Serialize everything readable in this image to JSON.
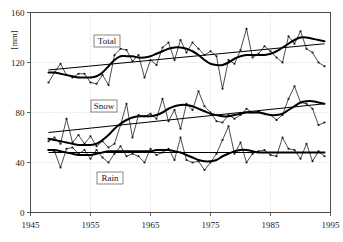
{
  "chart_data": {
    "type": "line",
    "title": "",
    "xlabel": "",
    "ylabel": "[mm]",
    "xlim": [
      1945,
      1995
    ],
    "ylim": [
      0,
      160
    ],
    "xticks": [
      1945,
      1955,
      1965,
      1975,
      1985,
      1995
    ],
    "yticks": [
      0,
      40,
      80,
      120,
      160
    ],
    "grid": true,
    "legend_position": "inline-boxed",
    "annotations": [
      "Total",
      "Snow",
      "Rain"
    ],
    "x": [
      1948,
      1949,
      1950,
      1951,
      1952,
      1953,
      1954,
      1955,
      1956,
      1957,
      1958,
      1959,
      1960,
      1961,
      1962,
      1963,
      1964,
      1965,
      1966,
      1967,
      1968,
      1969,
      1970,
      1971,
      1972,
      1973,
      1974,
      1975,
      1976,
      1977,
      1978,
      1979,
      1980,
      1981,
      1982,
      1983,
      1984,
      1985,
      1986,
      1987,
      1988,
      1989,
      1990,
      1991,
      1992,
      1993,
      1994
    ],
    "series": [
      {
        "name": "Total",
        "values": [
          104,
          112,
          119,
          110,
          108,
          111,
          111,
          104,
          103,
          110,
          102,
          126,
          131,
          130,
          121,
          126,
          108,
          122,
          118,
          132,
          136,
          122,
          138,
          128,
          136,
          131,
          126,
          129,
          125,
          99,
          122,
          119,
          130,
          147,
          124,
          127,
          133,
          129,
          124,
          120,
          141,
          135,
          145,
          131,
          128,
          120,
          117
        ],
        "trend": {
          "start_year": 1948,
          "start_value": 114,
          "end_year": 1994,
          "end_value": 135
        },
        "smooth": [
          112,
          112,
          111,
          110,
          109,
          108,
          108,
          108,
          109,
          112,
          117,
          122,
          125,
          125,
          125,
          124,
          124,
          125,
          127,
          129,
          131,
          132,
          132,
          131,
          129,
          126,
          122,
          119,
          118,
          118,
          120,
          123,
          125,
          126,
          126,
          126,
          126,
          127,
          129,
          132,
          135,
          138,
          140,
          140,
          139,
          138,
          137
        ]
      },
      {
        "name": "Snow",
        "values": [
          57,
          60,
          55,
          75,
          56,
          62,
          55,
          61,
          53,
          57,
          52,
          55,
          70,
          87,
          60,
          78,
          77,
          79,
          75,
          91,
          73,
          82,
          67,
          87,
          82,
          97,
          85,
          80,
          73,
          72,
          78,
          75,
          78,
          83,
          80,
          81,
          79,
          78,
          74,
          78,
          91,
          101,
          88,
          87,
          83,
          70,
          72
        ],
        "trend": {
          "start_year": 1948,
          "start_value": 64,
          "end_year": 1994,
          "end_value": 87
        },
        "smooth": [
          59,
          58,
          57,
          56,
          55,
          54,
          54,
          54,
          55,
          58,
          62,
          67,
          71,
          74,
          76,
          77,
          77,
          77,
          78,
          80,
          83,
          85,
          86,
          86,
          85,
          83,
          81,
          79,
          78,
          77,
          77,
          78,
          79,
          80,
          80,
          80,
          79,
          78,
          78,
          79,
          82,
          85,
          88,
          89,
          89,
          88,
          87
        ]
      },
      {
        "name": "Rain",
        "values": [
          50,
          49,
          36,
          51,
          52,
          47,
          50,
          43,
          50,
          44,
          40,
          47,
          53,
          45,
          47,
          45,
          40,
          51,
          46,
          48,
          51,
          42,
          60,
          42,
          40,
          41,
          34,
          40,
          47,
          58,
          69,
          47,
          56,
          40,
          47,
          49,
          50,
          46,
          45,
          60,
          51,
          50,
          43,
          55,
          41,
          49,
          45
        ]
      }
    ],
    "rain_trend": {
      "start_year": 1948,
      "start_value": 48,
      "end_year": 1994,
      "end_value": 48
    },
    "rain_smooth": [
      50,
      50,
      49,
      48,
      47,
      46,
      46,
      46,
      47,
      48,
      49,
      49,
      49,
      49,
      49,
      49,
      49,
      49,
      50,
      50,
      50,
      49,
      48,
      46,
      44,
      42,
      41,
      41,
      42,
      45,
      47,
      49,
      50,
      50,
      49,
      48,
      48,
      48,
      48,
      48,
      48,
      48,
      48,
      48,
      48,
      48,
      48
    ]
  }
}
